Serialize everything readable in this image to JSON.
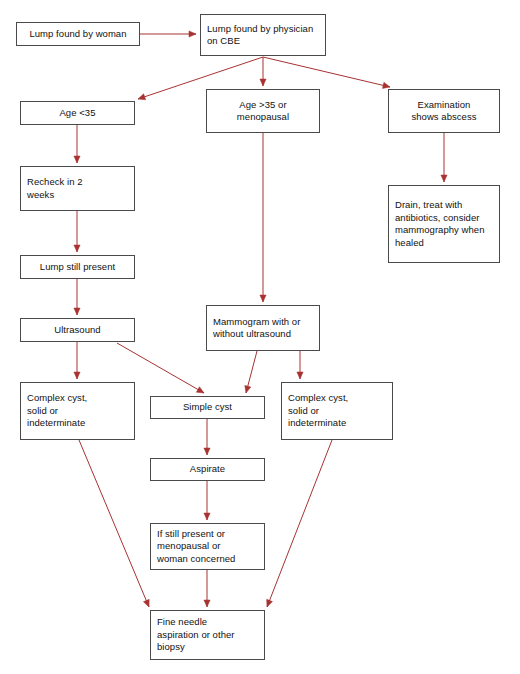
{
  "diagram": {
    "background_color": "#ffffff",
    "box_border_color": "#4a4a4a",
    "edge_color": "#a83232",
    "text_color": "#111111",
    "caption": "",
    "nodes": [
      {
        "id": "lump-found-by-woman",
        "text": "Lump found by woman",
        "x": 16,
        "y": 22,
        "w": 124,
        "h": 24,
        "align": "center"
      },
      {
        "id": "lump-found-by-physician",
        "text": "Lump found by physician\non CBE",
        "x": 200,
        "y": 14,
        "w": 126,
        "h": 42,
        "align": "left"
      },
      {
        "id": "age-under-35",
        "text": "Age <35",
        "x": 20,
        "y": 101,
        "w": 115,
        "h": 24,
        "align": "center"
      },
      {
        "id": "age-over-35-or-menopausal",
        "text": "Age >35 or\nmenopausal",
        "x": 206,
        "y": 89,
        "w": 114,
        "h": 44,
        "align": "center"
      },
      {
        "id": "examination-shows-abscess",
        "text": "Examination\nshows abscess",
        "x": 388,
        "y": 89,
        "w": 112,
        "h": 44,
        "align": "center"
      },
      {
        "id": "recheck-in-2-weeks",
        "text": "Recheck in 2\nweeks",
        "x": 20,
        "y": 166,
        "w": 115,
        "h": 45,
        "align": "left"
      },
      {
        "id": "drain-treat-antibiotics",
        "text": "Drain, treat with\nantibiotics, consider\nmammography when\nhealed",
        "x": 388,
        "y": 185,
        "w": 112,
        "h": 78,
        "align": "left"
      },
      {
        "id": "lump-still-present",
        "text": "Lump still present",
        "x": 20,
        "y": 255,
        "w": 115,
        "h": 24,
        "align": "center"
      },
      {
        "id": "mammogram-with-or-without-ultrasound",
        "text": "Mammogram with or\nwithout ultrasound",
        "x": 206,
        "y": 305,
        "w": 114,
        "h": 46,
        "align": "left"
      },
      {
        "id": "ultrasound",
        "text": "Ultrasound",
        "x": 20,
        "y": 318,
        "w": 115,
        "h": 24,
        "align": "center"
      },
      {
        "id": "complex-cyst-left",
        "text": "Complex cyst,\nsolid or\nindeterminate",
        "x": 20,
        "y": 382,
        "w": 115,
        "h": 58,
        "align": "left"
      },
      {
        "id": "simple-cyst",
        "text": "Simple cyst",
        "x": 150,
        "y": 396,
        "w": 115,
        "h": 23,
        "align": "center"
      },
      {
        "id": "complex-cyst-right",
        "text": "Complex cyst,\nsolid or\nindeterminate",
        "x": 281,
        "y": 382,
        "w": 112,
        "h": 58,
        "align": "left"
      },
      {
        "id": "aspirate",
        "text": "Aspirate",
        "x": 150,
        "y": 458,
        "w": 115,
        "h": 23,
        "align": "center"
      },
      {
        "id": "if-still-present",
        "text": "If still present or\nmenopausal or\nwoman concerned",
        "x": 150,
        "y": 523,
        "w": 115,
        "h": 47,
        "align": "left"
      },
      {
        "id": "fine-needle-aspiration",
        "text": "Fine needle\naspiration or other\nbiopsy",
        "x": 150,
        "y": 610,
        "w": 115,
        "h": 50,
        "align": "left"
      }
    ],
    "edges": [
      {
        "id": "woman-to-physician",
        "from": "lump-found-by-woman",
        "to": "lump-found-by-physician",
        "points": "140,34 196,34",
        "arrow": true
      },
      {
        "id": "physician-to-age-under-35",
        "from": "lump-found-by-physician",
        "to": "age-under-35",
        "points": "263,57 138,99",
        "arrow": true
      },
      {
        "id": "physician-to-age-over-35",
        "from": "lump-found-by-physician",
        "to": "age-over-35-or-menopausal",
        "points": "263,57 263,86",
        "arrow": true
      },
      {
        "id": "physician-to-abscess",
        "from": "lump-found-by-physician",
        "to": "examination-shows-abscess",
        "points": "263,57 390,87",
        "arrow": true
      },
      {
        "id": "age-under-35-to-recheck",
        "from": "age-under-35",
        "to": "recheck-in-2-weeks",
        "points": "77,125 77,163",
        "arrow": true
      },
      {
        "id": "abscess-to-drain",
        "from": "examination-shows-abscess",
        "to": "drain-treat-antibiotics",
        "points": "444,133 444,182",
        "arrow": true
      },
      {
        "id": "recheck-to-lump-still-present",
        "from": "recheck-in-2-weeks",
        "to": "lump-still-present",
        "points": "77,211 77,252",
        "arrow": true
      },
      {
        "id": "lump-still-present-to-ultrasound",
        "from": "lump-still-present",
        "to": "ultrasound",
        "points": "77,279 77,315",
        "arrow": true
      },
      {
        "id": "age-over-35-to-mammogram",
        "from": "age-over-35-or-menopausal",
        "to": "mammogram-with-or-without-ultrasound",
        "points": "263,133 263,302",
        "arrow": true
      },
      {
        "id": "ultrasound-to-complex-cyst-left",
        "from": "ultrasound",
        "to": "complex-cyst-left",
        "points": "77,342 77,379",
        "arrow": true
      },
      {
        "id": "ultrasound-to-simple-cyst",
        "from": "ultrasound",
        "to": "simple-cyst",
        "points": "117,343 204,393",
        "arrow": true
      },
      {
        "id": "mammogram-to-simple-cyst",
        "from": "mammogram-with-or-without-ultrasound",
        "to": "simple-cyst",
        "points": "257,351 246,393",
        "arrow": true
      },
      {
        "id": "mammogram-to-complex-cyst-right",
        "from": "mammogram-with-or-without-ultrasound",
        "to": "complex-cyst-right",
        "points": "300,351 300,379",
        "arrow": true
      },
      {
        "id": "simple-cyst-to-aspirate",
        "from": "simple-cyst",
        "to": "aspirate",
        "points": "207,419 207,455",
        "arrow": true
      },
      {
        "id": "aspirate-to-if-still-present",
        "from": "aspirate",
        "to": "if-still-present",
        "points": "207,481 207,520",
        "arrow": true
      },
      {
        "id": "complex-cyst-left-to-fine-needle",
        "from": "complex-cyst-left",
        "to": "fine-needle-aspiration",
        "points": "79,440 149,607",
        "arrow": true
      },
      {
        "id": "if-still-present-to-fine-needle",
        "from": "if-still-present",
        "to": "fine-needle-aspiration",
        "points": "207,570 207,607",
        "arrow": true
      },
      {
        "id": "complex-cyst-right-to-fine-needle",
        "from": "complex-cyst-right",
        "to": "fine-needle-aspiration",
        "points": "332,440 267,607",
        "arrow": true
      }
    ]
  }
}
